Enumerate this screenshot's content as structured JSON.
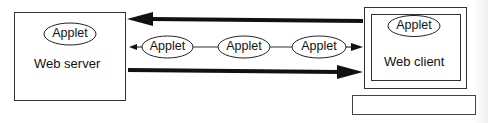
{
  "diagram": {
    "server": {
      "label": "Web server",
      "applet_label": "Applet"
    },
    "client": {
      "label": "Web client",
      "applet_label": "Applet"
    },
    "transfer": {
      "applets": [
        {
          "label": "Applet"
        },
        {
          "label": "Applet"
        },
        {
          "label": "Applet"
        }
      ]
    },
    "arrows": {
      "top": {
        "direction": "client-to-server"
      },
      "middle": {
        "direction": "bidirectional-chain"
      },
      "bottom": {
        "direction": "server-to-client"
      }
    },
    "colors": {
      "stroke": "#1a1a1a",
      "background": "#ffffff"
    }
  }
}
